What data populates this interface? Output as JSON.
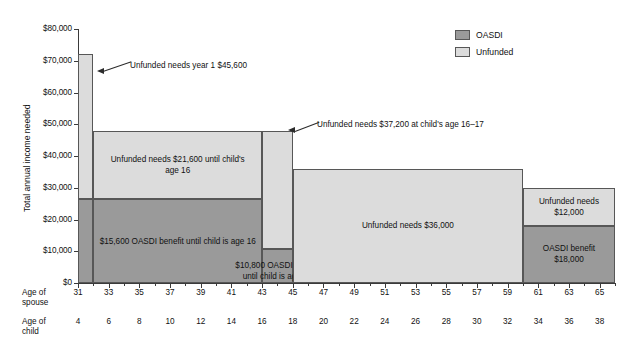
{
  "chart_data": {
    "type": "bar",
    "title": "",
    "subtitle": "",
    "xlabel": "",
    "ylabel": "Total annual income needed",
    "ylim": [
      0,
      80000
    ],
    "ytick_labels": [
      "$0",
      "$10,000",
      "$20,000",
      "$30,000",
      "$40,000",
      "$50,000",
      "$60,000",
      "$70,000",
      "$80,000"
    ],
    "ytick_values": [
      0,
      10000,
      20000,
      30000,
      40000,
      50000,
      60000,
      70000,
      80000
    ],
    "grid": false,
    "legend_position": "top-right",
    "legend": [
      {
        "label": "OASDI",
        "color": "#9a9a9a"
      },
      {
        "label": "Unfunded",
        "color": "#dcdcdc"
      }
    ],
    "x_axis_rows": [
      {
        "title_line1": "Age of",
        "title_line2": "spouse",
        "ticks": [
          31,
          33,
          35,
          37,
          39,
          41,
          43,
          45,
          47,
          49,
          51,
          53,
          55,
          57,
          59,
          61,
          63,
          65
        ],
        "range": [
          31,
          66
        ]
      },
      {
        "title_line1": "Age of",
        "title_line2": "child",
        "ticks": [
          4,
          6,
          8,
          10,
          12,
          14,
          16,
          18,
          20,
          22,
          24,
          26,
          28,
          30,
          32,
          34,
          36,
          38
        ],
        "range": [
          4,
          39
        ]
      }
    ],
    "stacked_segments": [
      {
        "name": "year-1",
        "spouse_age_start": 31,
        "spouse_age_end": 32,
        "child_age_start": 4,
        "child_age_end": 5,
        "oasdi": 26400,
        "unfunded": 45600,
        "total": 72000,
        "oasdi_label": "",
        "unfunded_label": ""
      },
      {
        "name": "until-child-age-16",
        "spouse_age_start": 32,
        "spouse_age_end": 43,
        "child_age_start": 5,
        "child_age_end": 16,
        "oasdi": 26400,
        "unfunded": 21600,
        "total": 48000,
        "oasdi_label": "$15,600 OASDI benefit until child is age 16",
        "unfunded_label": "Unfunded needs $21,600 until child's\nage 16"
      },
      {
        "name": "child-age-16-17",
        "spouse_age_start": 43,
        "spouse_age_end": 45,
        "child_age_start": 16,
        "child_age_end": 18,
        "oasdi": 10800,
        "unfunded": 37200,
        "total": 48000,
        "oasdi_label": "$10,800 OASDI benefit until child is age 18",
        "unfunded_label": ""
      },
      {
        "name": "after-child-18",
        "spouse_age_start": 45,
        "spouse_age_end": 60,
        "child_age_start": 18,
        "child_age_end": 33,
        "oasdi": 0,
        "unfunded": 36000,
        "total": 36000,
        "oasdi_label": "",
        "unfunded_label": "Unfunded needs $36,000"
      },
      {
        "name": "retirement",
        "spouse_age_start": 60,
        "spouse_age_end": 66,
        "child_age_start": 33,
        "child_age_end": 39,
        "oasdi": 18000,
        "unfunded": 12000,
        "total": 30000,
        "oasdi_label": "OASDI benefit\n$18,000",
        "unfunded_label": "Unfunded needs\n$12,000"
      }
    ],
    "annotations": [
      {
        "name": "annot-year-1",
        "text": "Unfunded needs year 1 $45,600"
      },
      {
        "name": "annot-child-16-17",
        "text": "Unfunded needs $37,200 at child's age 16–17"
      }
    ],
    "bar_labels": {
      "oasdi_15600": "$15,600 OASDI benefit until child is age 16",
      "oasdi_10800": "$10,800 OASDI benefit until child is age 18",
      "unfunded_21600_line1": "Unfunded needs $21,600 until child's",
      "unfunded_21600_line2": "age 16",
      "unfunded_36000": "Unfunded needs $36,000",
      "unfunded_12000_line1": "Unfunded needs",
      "unfunded_12000_line2": "$12,000",
      "oasdi_18000_line1": "OASDI benefit",
      "oasdi_18000_line2": "$18,000"
    },
    "colors": {
      "oasdi": "#9a9a9a",
      "unfunded": "#dcdcdc",
      "axis": "#3a3a3a",
      "border": "#575757",
      "background": "#ffffff"
    }
  }
}
